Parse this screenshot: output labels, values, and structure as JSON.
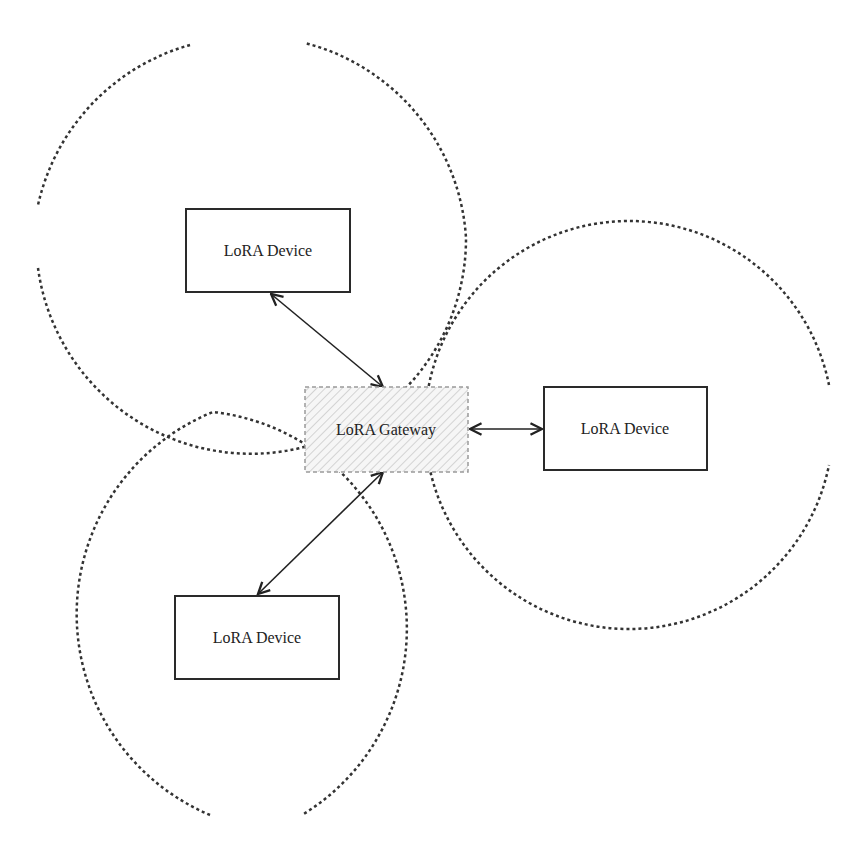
{
  "diagram": {
    "type": "network-topology",
    "gateway": {
      "label": "LoRA Gateway",
      "x": 305,
      "y": 387,
      "w": 163,
      "h": 85
    },
    "devices": [
      {
        "id": "device-top-left",
        "label": "LoRA Device",
        "x": 186,
        "y": 209,
        "w": 164,
        "h": 83
      },
      {
        "id": "device-right",
        "label": "LoRA Device",
        "x": 544,
        "y": 387,
        "w": 163,
        "h": 83
      },
      {
        "id": "device-bottom-left",
        "label": "LoRA Device",
        "x": 175,
        "y": 596,
        "w": 164,
        "h": 83
      }
    ],
    "coverage_ranges": [
      {
        "id": "range-top-left",
        "cx": 251,
        "cy": 237,
        "r": 215
      },
      {
        "id": "range-bottom-left",
        "cx": 257,
        "cy": 625,
        "r": 218
      },
      {
        "id": "range-right",
        "cx": 626,
        "cy": 428,
        "r": 204
      }
    ],
    "links": [
      {
        "id": "link-top-left",
        "from": "gateway",
        "to": "device-top-left",
        "bidirectional": true
      },
      {
        "id": "link-right",
        "from": "gateway",
        "to": "device-right",
        "bidirectional": true
      },
      {
        "id": "link-bottom-left",
        "from": "gateway",
        "to": "device-bottom-left",
        "bidirectional": true
      }
    ],
    "colors": {
      "stroke": "#222222",
      "range_stroke": "#333333",
      "gateway_border": "#9a9a9a",
      "gateway_hatch": "#c8c8c8",
      "background": "#ffffff"
    }
  }
}
